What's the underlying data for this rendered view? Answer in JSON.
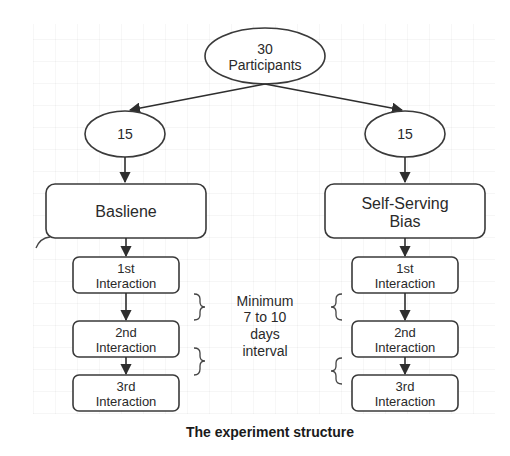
{
  "diagram": {
    "root": {
      "line1": "30",
      "line2": "Participants"
    },
    "groups": [
      {
        "count": "15",
        "condition": {
          "line1": "Basliene",
          "line2": ""
        },
        "interactions": [
          {
            "line1": "1st",
            "line2": "Interaction"
          },
          {
            "line1": "2nd",
            "line2": "Interaction"
          },
          {
            "line1": "3rd",
            "line2": "Interaction"
          }
        ]
      },
      {
        "count": "15",
        "condition": {
          "line1": "Self-Serving",
          "line2": "Bias"
        },
        "interactions": [
          {
            "line1": "1st",
            "line2": "Interaction"
          },
          {
            "line1": "2nd",
            "line2": "Interaction"
          },
          {
            "line1": "3rd",
            "line2": "Interaction"
          }
        ]
      }
    ],
    "interval_note": {
      "line1": "Minimum",
      "line2": "7 to 10",
      "line3": "days",
      "line4": "interval"
    },
    "caption": "The experiment structure",
    "colors": {
      "stroke": "#3a3a3a",
      "text": "#2a2a2a",
      "background": "#ffffff"
    }
  }
}
